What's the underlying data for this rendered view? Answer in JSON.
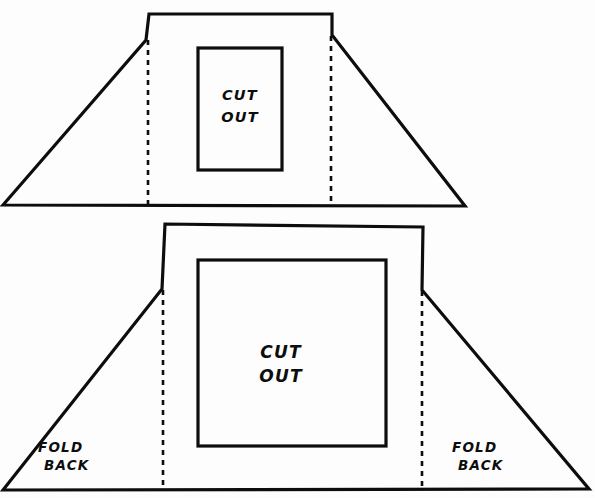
{
  "document": {
    "title": "Fold-and-cut template diagram",
    "background_color": "#fdfdfd",
    "ink_color": "#0d0d0d",
    "width": 595,
    "height": 498
  },
  "shapes": {
    "top_piece": {
      "name": "upper-template-piece",
      "description": "Trapezoid with a raised rectangular center tab and a rectangular cut-out window",
      "outer_path": "M 3,205 L 146,40 L 149,14 L 332,14 L 332,35 L 465,206 L 3,205 Z",
      "cutout_rect": {
        "x": 198,
        "y": 48,
        "width": 84,
        "height": 122
      },
      "fold_lines": [
        {
          "name": "fold-line-left",
          "x": 148,
          "y1": 40,
          "y2": 204
        },
        {
          "name": "fold-line-right",
          "x": 331,
          "y1": 36,
          "y2": 204
        }
      ],
      "cut_label": {
        "line1": "CUT",
        "line2": "OUT",
        "x": 240,
        "y1": 100,
        "y2": 122
      }
    },
    "bottom_piece": {
      "name": "lower-template-piece",
      "description": "Larger trapezoid with a raised rectangular center tab, a square cut-out window, and fold-back wings",
      "outer_path": "M 3,490 L 162,289 L 165,224 L 423,227 L 422,290 L 589,489 L 3,490 Z",
      "cutout_rect": {
        "x": 198,
        "y": 260,
        "width": 188,
        "height": 186
      },
      "fold_lines": [
        {
          "name": "fold-line-left",
          "x": 163,
          "y1": 290,
          "y2": 489
        },
        {
          "name": "fold-line-right",
          "x": 422,
          "y1": 291,
          "y2": 489
        }
      ],
      "cut_label": {
        "line1": "CUT",
        "line2": "OUT",
        "x": 281,
        "y1": 358,
        "y2": 382
      },
      "fold_label_left": {
        "line1": "FOLD",
        "line2": "BACK",
        "x1": 38,
        "y1": 452,
        "x2": 44,
        "y2": 470
      },
      "fold_label_right": {
        "line1": "FOLD",
        "line2": "BACK",
        "x1": 452,
        "y1": 452,
        "x2": 458,
        "y2": 470
      }
    }
  },
  "labels": {
    "cut_out_line1": "CUT",
    "cut_out_line2": "OUT",
    "fold_back_line1": "FOLD",
    "fold_back_line2": "BACK"
  }
}
